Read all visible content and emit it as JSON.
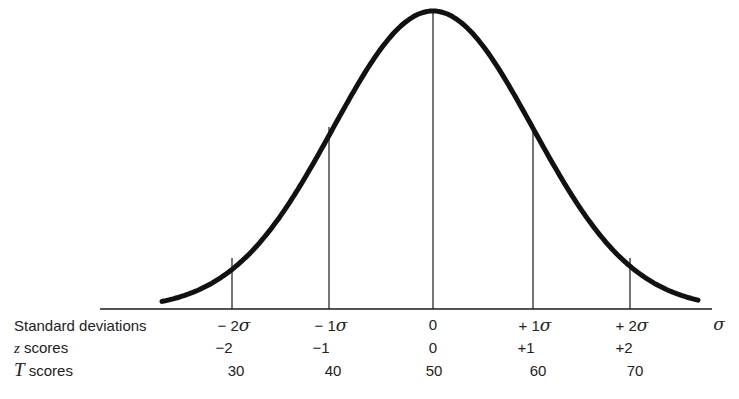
{
  "chart_data": {
    "type": "line",
    "title": "",
    "x_axis_symbol": "σ",
    "rows": [
      {
        "label_prefix": "",
        "label": "Standard deviations",
        "values": [
          "−2σ",
          "−1σ",
          "0",
          "+1σ",
          "+2σ"
        ]
      },
      {
        "label_prefix": "z",
        "label": " scores",
        "values": [
          "−2",
          "−1",
          "0",
          "+1",
          "+2"
        ]
      },
      {
        "label_prefix": "T",
        "label": " scores",
        "values": [
          "30",
          "40",
          "50",
          "60",
          "70"
        ]
      }
    ],
    "sd_positions": [
      -2,
      -1,
      0,
      1,
      2
    ],
    "x_range_sd": [
      -3.3,
      2.75
    ],
    "curve": "normal",
    "grid": false,
    "legend": false
  },
  "labels": {
    "sd_row": "Standard deviations",
    "z_prefix": "z",
    "z_row": " scores",
    "t_prefix": "T",
    "t_row": " scores",
    "axis_symbol": "σ"
  },
  "ticks": {
    "sd": [
      {
        "sign": "−",
        "num": "2",
        "sym": "σ"
      },
      {
        "sign": "−",
        "num": "1",
        "sym": "σ"
      },
      {
        "sign": "",
        "num": "0",
        "sym": ""
      },
      {
        "sign": "+",
        "num": "1",
        "sym": "σ"
      },
      {
        "sign": "+",
        "num": "2",
        "sym": "σ"
      }
    ],
    "z": [
      "−2",
      "−1",
      "0",
      "+1",
      "+2"
    ],
    "t": [
      "30",
      "40",
      "50",
      "60",
      "70"
    ]
  }
}
